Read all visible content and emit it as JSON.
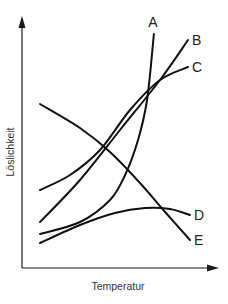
{
  "chart_data": {
    "type": "line",
    "title": "",
    "xlabel": "Temperatur",
    "ylabel": "Löslichkeit",
    "xlim": [
      0,
      10
    ],
    "ylim": [
      0,
      10
    ],
    "grid": false,
    "ticks": false,
    "legend": "inline-right",
    "series": [
      {
        "name": "A",
        "x": [
          0.92,
          2.96,
          4.49,
          5.26,
          5.92,
          6.38,
          6.73
        ],
        "y": [
          1.36,
          1.84,
          2.72,
          3.72,
          5.12,
          6.72,
          9.36
        ]
      },
      {
        "name": "B",
        "x": [
          0.92,
          2.96,
          5.0,
          7.04,
          8.47
        ],
        "y": [
          1.84,
          3.52,
          5.52,
          7.52,
          9.12
        ]
      },
      {
        "name": "C",
        "x": [
          0.92,
          2.45,
          3.98,
          5.51,
          7.04,
          8.47
        ],
        "y": [
          3.12,
          3.72,
          4.72,
          6.32,
          7.52,
          8.04
        ]
      },
      {
        "name": "D",
        "x": [
          0.92,
          2.96,
          4.74,
          6.28,
          7.55,
          8.57
        ],
        "y": [
          1.0,
          1.72,
          2.2,
          2.4,
          2.36,
          2.12
        ]
      },
      {
        "name": "E",
        "x": [
          0.92,
          2.96,
          4.49,
          6.02,
          7.3,
          8.57
        ],
        "y": [
          6.56,
          5.6,
          4.64,
          3.4,
          2.24,
          1.12
        ]
      }
    ]
  }
}
